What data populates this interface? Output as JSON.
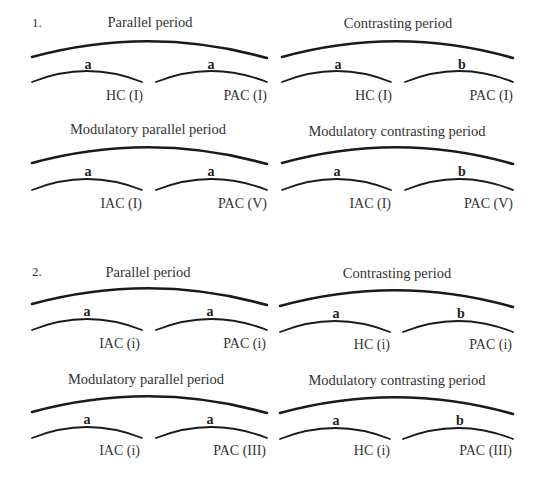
{
  "sections": [
    {
      "number": "1.",
      "diagrams": [
        {
          "title": "Parallel period",
          "phrases": [
            {
              "letter": "a",
              "cadence": "HC (I)"
            },
            {
              "letter": "a",
              "cadence": "PAC (I)"
            }
          ]
        },
        {
          "title": "Contrasting period",
          "phrases": [
            {
              "letter": "a",
              "cadence": "HC (I)"
            },
            {
              "letter": "b",
              "cadence": "PAC (I)"
            }
          ]
        },
        {
          "title": "Modulatory parallel period",
          "phrases": [
            {
              "letter": "a",
              "cadence": "IAC (I)"
            },
            {
              "letter": "a",
              "cadence": "PAC (V)"
            }
          ]
        },
        {
          "title": "Modulatory contrasting period",
          "phrases": [
            {
              "letter": "a",
              "cadence": "IAC (I)"
            },
            {
              "letter": "b",
              "cadence": "PAC (V)"
            }
          ]
        }
      ]
    },
    {
      "number": "2.",
      "diagrams": [
        {
          "title": "Parallel period",
          "phrases": [
            {
              "letter": "a",
              "cadence": "IAC (i)"
            },
            {
              "letter": "a",
              "cadence": "PAC (i)"
            }
          ]
        },
        {
          "title": "Contrasting period",
          "phrases": [
            {
              "letter": "a",
              "cadence": "HC (i)"
            },
            {
              "letter": "b",
              "cadence": "PAC (i)"
            }
          ]
        },
        {
          "title": "Modulatory parallel period",
          "phrases": [
            {
              "letter": "a",
              "cadence": "IAC (i)"
            },
            {
              "letter": "a",
              "cadence": "PAC (III)"
            }
          ]
        },
        {
          "title": "Modulatory contrasting period",
          "phrases": [
            {
              "letter": "a",
              "cadence": "HC (i)"
            },
            {
              "letter": "b",
              "cadence": "PAC (III)"
            }
          ]
        }
      ]
    }
  ]
}
